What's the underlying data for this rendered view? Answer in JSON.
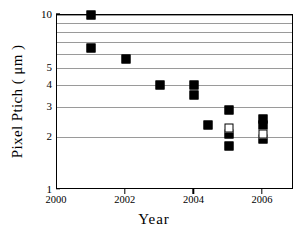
{
  "chart_data": {
    "type": "scatter",
    "title": "",
    "xlabel": "Year",
    "ylabel": "Pixel Ptich ( μm )",
    "xlim": [
      2000,
      2006.9
    ],
    "ylim": [
      1,
      10
    ],
    "yscale": "log",
    "xscale": "linear",
    "grid": "horizontal",
    "legend": "none",
    "xticks": [
      2000,
      2002,
      2004,
      2006
    ],
    "xtick_labels": [
      "2000",
      "2002",
      "2004",
      "2006"
    ],
    "yticks": [
      1,
      2,
      3,
      4,
      5,
      10
    ],
    "ytick_labels": [
      "1",
      "2",
      "3",
      "4",
      "5",
      "10"
    ],
    "ygridlines": [
      2,
      3,
      4,
      5,
      6,
      7,
      8,
      9,
      10
    ],
    "series": [
      {
        "name": "filled-square",
        "marker": "filled square",
        "color": "#000000",
        "points": [
          {
            "x": 2001.0,
            "y": 10.0
          },
          {
            "x": 2001.0,
            "y": 6.5
          },
          {
            "x": 2002.0,
            "y": 5.6
          },
          {
            "x": 2003.0,
            "y": 4.0
          },
          {
            "x": 2004.0,
            "y": 4.0
          },
          {
            "x": 2004.0,
            "y": 3.5
          },
          {
            "x": 2004.4,
            "y": 2.35
          },
          {
            "x": 2005.0,
            "y": 2.85
          },
          {
            "x": 2005.0,
            "y": 2.1
          },
          {
            "x": 2005.0,
            "y": 1.78
          },
          {
            "x": 2006.0,
            "y": 2.55
          },
          {
            "x": 2006.0,
            "y": 2.35
          },
          {
            "x": 2006.0,
            "y": 1.95
          }
        ]
      },
      {
        "name": "open-square",
        "marker": "open square",
        "color": "#ffffff",
        "points": [
          {
            "x": 2005.0,
            "y": 2.25
          },
          {
            "x": 2006.0,
            "y": 2.1
          }
        ]
      }
    ]
  },
  "colors": {
    "axis": "#000000",
    "grid": "#9a9a9a",
    "background": "#ffffff"
  }
}
